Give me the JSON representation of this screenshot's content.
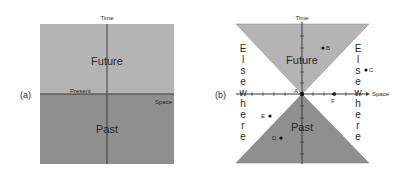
{
  "panel_a": {
    "label": "(a)",
    "time_axis": "Time",
    "space_axis": "Space",
    "future": "Future",
    "past": "Past",
    "present": "Present",
    "colors": {
      "future": "#b4b4b4",
      "past": "#8f8f8f",
      "axis": "#3a3a3a"
    }
  },
  "panel_b": {
    "label": "(b)",
    "time_axis": "Time",
    "space_axis": "Space",
    "future": "Future",
    "past": "Past",
    "elsewhere_left": [
      "E",
      "l",
      "s",
      "e",
      "w",
      "h",
      "e",
      "r",
      "e"
    ],
    "elsewhere_right": [
      "E",
      "l",
      "s",
      "e",
      "w",
      "h",
      "e",
      "r",
      "e"
    ],
    "points": [
      {
        "id": "A"
      },
      {
        "id": "B"
      },
      {
        "id": "C"
      },
      {
        "id": "D"
      },
      {
        "id": "E"
      },
      {
        "id": "F"
      }
    ],
    "colors": {
      "future": "#b4b4b4",
      "past": "#8f8f8f",
      "axis": "#3a3a3a"
    }
  }
}
